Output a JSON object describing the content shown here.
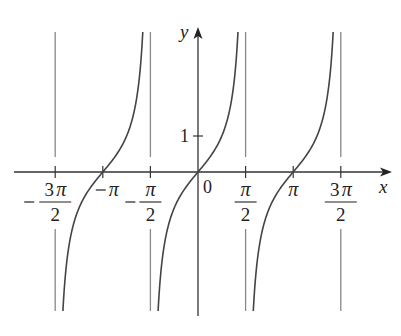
{
  "chart_data": {
    "type": "line",
    "title": "",
    "function": "y = tan(x)",
    "xlabel": "x",
    "ylabel": "y",
    "xlim": [
      -4.63,
      6.16
    ],
    "ylim": [
      -3.86,
      3.89
    ],
    "grid": false,
    "legend": null,
    "x_ticks": [
      {
        "value": -4.712,
        "label": "-3π/2",
        "neg": true,
        "num": "3π",
        "den": "2"
      },
      {
        "value": -3.1416,
        "label": "-π",
        "neg": true,
        "num": "π",
        "den": ""
      },
      {
        "value": -1.5708,
        "label": "-π/2",
        "neg": true,
        "num": "π",
        "den": "2"
      },
      {
        "value": 0,
        "label": "0",
        "neg": false,
        "num": "0",
        "den": ""
      },
      {
        "value": 1.5708,
        "label": "π/2",
        "neg": false,
        "num": "π",
        "den": "2"
      },
      {
        "value": 3.1416,
        "label": "π",
        "neg": false,
        "num": "π",
        "den": ""
      },
      {
        "value": 4.712,
        "label": "3π/2",
        "neg": false,
        "num": "3π",
        "den": "2"
      }
    ],
    "y_ticks": [
      {
        "value": 1,
        "label": "1"
      }
    ],
    "asymptotes": [
      -4.712,
      -1.5708,
      1.5708,
      4.712
    ],
    "series": [
      {
        "name": "tan(x) branch 1",
        "x_range": [
          -4.45,
          -1.84
        ]
      },
      {
        "name": "tan(x) branch 2",
        "x_range": [
          -1.3,
          1.31
        ]
      },
      {
        "name": "tan(x) branch 3",
        "x_range": [
          1.84,
          4.45
        ]
      }
    ],
    "colors": {
      "curve": "#444444",
      "axis": "#333333",
      "asymptote": "#888888"
    }
  },
  "labels": {
    "x_axis": "x",
    "y_axis": "y",
    "one": "1",
    "zero": "0"
  }
}
